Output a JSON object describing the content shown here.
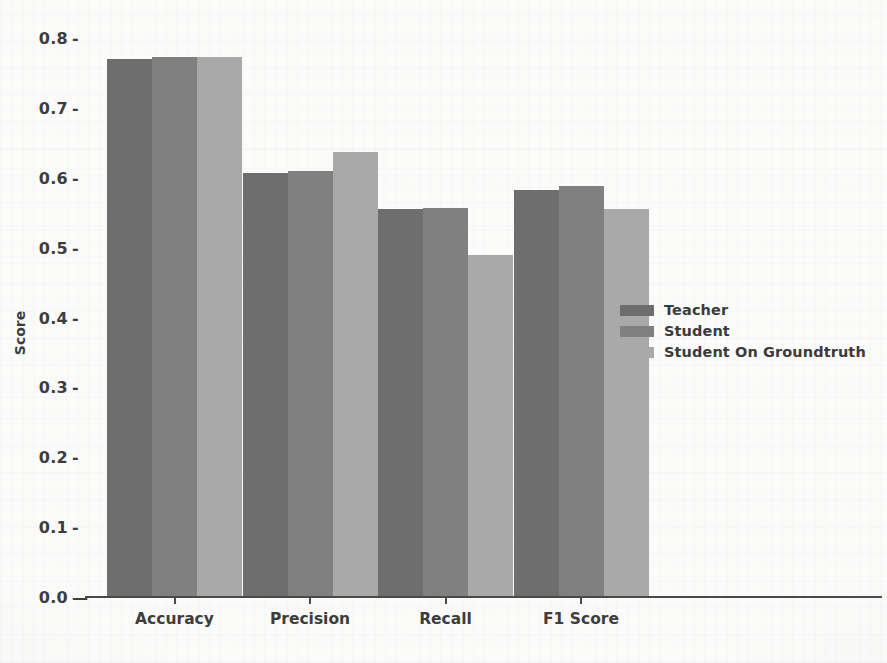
{
  "chart_data": {
    "type": "bar",
    "title": "",
    "xlabel": "",
    "ylabel": "Score",
    "categories": [
      "Accuracy",
      "Precision",
      "Recall",
      "F1 Score"
    ],
    "ylim": [
      0.0,
      0.8
    ],
    "ytick_labels": [
      "0.0",
      "0.1",
      "0.2",
      "0.3",
      "0.4",
      "0.5",
      "0.6",
      "0.7",
      "0.8"
    ],
    "ytick_values": [
      0.0,
      0.1,
      0.2,
      0.3,
      0.4,
      0.5,
      0.6,
      0.7,
      0.8
    ],
    "grid": false,
    "legend_position": "center right",
    "series": [
      {
        "name": "Teacher",
        "color": "#6e6e6e",
        "values": [
          0.77,
          0.607,
          0.556,
          0.582
        ]
      },
      {
        "name": "Student",
        "color": "#808080",
        "values": [
          0.773,
          0.61,
          0.557,
          0.588
        ]
      },
      {
        "name": "Student On Groundtruth",
        "color": "#a9a9a9",
        "values": [
          0.773,
          0.637,
          0.49,
          0.556
        ]
      }
    ]
  },
  "axis": {
    "y_label": "Score"
  }
}
